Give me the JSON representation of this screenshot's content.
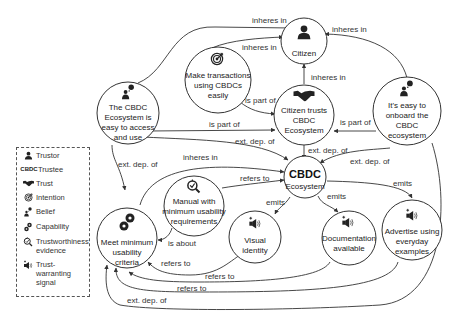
{
  "nodes": {
    "citizen": {
      "label": "Citizen",
      "icon": "person-icon"
    },
    "make_transactions": {
      "lines": [
        "Make transactions",
        "using CBDCs",
        "easily"
      ],
      "icon": "target-icon"
    },
    "ecosystem_easy": {
      "lines": [
        "The CBDC",
        "Ecosystem is",
        "easy to access",
        "and use"
      ],
      "icon": "belief-icon"
    },
    "citizen_trusts": {
      "lines": [
        "Citizen trusts",
        "CBDC",
        "Ecosystem"
      ],
      "icon": "handshake-icon"
    },
    "easy_onboard": {
      "lines": [
        "It's easy to",
        "onboard the",
        "CBDC",
        "ecosystem"
      ],
      "icon": "belief-icon"
    },
    "cbdc_ecosystem": {
      "title": "CBDC",
      "subtitle": "Ecosystem"
    },
    "manual": {
      "lines": [
        "Manual with",
        "minimum usability",
        "requirements"
      ],
      "icon": "magnifier-check-icon"
    },
    "meet_criteria": {
      "lines": [
        "Meet minimum",
        "usability",
        "criteria"
      ],
      "icon": "gears-icon"
    },
    "visual_identity": {
      "lines": [
        "Visual",
        "identity"
      ],
      "icon": "megaphone-icon"
    },
    "documentation": {
      "lines": [
        "Documentation",
        "available"
      ],
      "icon": "megaphone-icon"
    },
    "advertise": {
      "lines": [
        "Advertise using",
        "everyday",
        "examples"
      ],
      "icon": "megaphone-icon"
    }
  },
  "edges": {
    "e1": "inheres in",
    "e2": "inheres in",
    "e3": "inheres in",
    "e4": "inheres in",
    "e5": "is part of",
    "e6": "is part of",
    "e7": "is part of",
    "e8": "ext. dep. of",
    "e9": "ext. dep. of",
    "e10": "ext. dep. of",
    "e11": "ext. dep. of",
    "e12": "inheres in",
    "e13": "refers to",
    "e14": "is about",
    "e15": "emits",
    "e16": "emits",
    "e17": "emits",
    "e18": "refers to",
    "e19": "refers to",
    "e20": "refers to",
    "e21": "ext. dep. of"
  },
  "legend": {
    "items": [
      {
        "icon": "person-icon",
        "label": "Trustor"
      },
      {
        "icon": "cbdc-text-icon",
        "icon_text": "CBDC",
        "label": "Trustee"
      },
      {
        "icon": "handshake-icon",
        "label": "Trust"
      },
      {
        "icon": "target-icon",
        "label": "Intention"
      },
      {
        "icon": "belief-icon",
        "label": "Belief"
      },
      {
        "icon": "gears-icon",
        "label": "Capability"
      },
      {
        "icon": "magnifier-check-icon",
        "label": "Trustworthiness evidence"
      },
      {
        "icon": "megaphone-icon",
        "label": "Trust-warranting signal"
      }
    ]
  }
}
